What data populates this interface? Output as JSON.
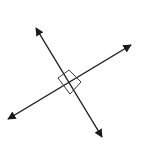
{
  "diagram": {
    "colors": {
      "background": "#ffffff",
      "line": "#1a1a1a",
      "marker": "#3a3a3a"
    },
    "lines": [
      {
        "name": "line-a",
        "x1": 36,
        "y1": 28,
        "x2": 102,
        "y2": 137
      },
      {
        "name": "line-b",
        "x1": 8,
        "y1": 119,
        "x2": 131,
        "y2": 45
      }
    ],
    "intersection": {
      "x": 69.5,
      "y": 82
    },
    "right_angle_marker": {
      "points": [
        [
          58,
          78
        ],
        [
          69,
          70
        ],
        [
          81,
          82
        ],
        [
          70,
          94
        ]
      ]
    }
  }
}
